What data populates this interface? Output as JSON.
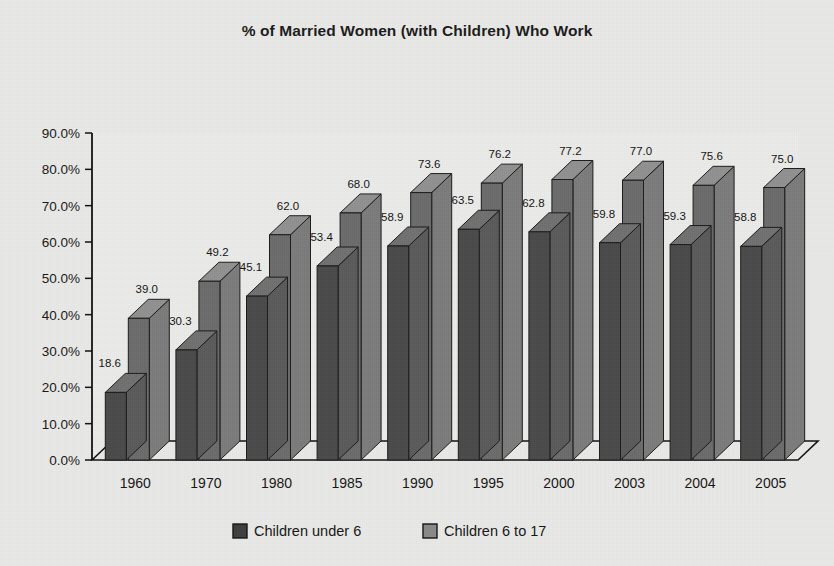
{
  "chart_data": {
    "type": "bar",
    "title": "% of Married Women (with Children) Who Work",
    "xlabel": "",
    "ylabel": "",
    "categories": [
      "1960",
      "1970",
      "1980",
      "1985",
      "1990",
      "1995",
      "2000",
      "2003",
      "2004",
      "2005"
    ],
    "series": [
      {
        "name": "Children under 6",
        "color": "#4a4a4a",
        "values": [
          18.6,
          30.3,
          45.1,
          53.4,
          58.9,
          63.5,
          62.8,
          59.8,
          59.3,
          58.8
        ]
      },
      {
        "name": "Children 6 to 17",
        "color": "#6b6b6b",
        "values": [
          39.0,
          49.2,
          62.0,
          68.0,
          73.6,
          76.2,
          77.2,
          77.0,
          75.6,
          75.0
        ]
      }
    ],
    "ylim": [
      0,
      90
    ],
    "ytick_values": [
      0,
      10,
      20,
      30,
      40,
      50,
      60,
      70,
      80,
      90
    ],
    "ytick_labels": [
      "0.0%",
      "10.0%",
      "20.0%",
      "30.0%",
      "40.0%",
      "50.0%",
      "60.0%",
      "70.0%",
      "80.0%",
      "90.0%"
    ],
    "grid": false,
    "legend_position": "bottom",
    "style": "3d-column",
    "data_label_format": "one-decimal"
  },
  "legend": {
    "entries": [
      {
        "label": "Children under 6",
        "swatch_color": "#3f3f3f"
      },
      {
        "label": "Children 6 to 17",
        "swatch_color": "#8a8a8a"
      }
    ]
  },
  "colors": {
    "background": "#e9e9e7",
    "plot_background": "#ebebe9",
    "axis": "#111111",
    "series_dark": "#4a4a4a",
    "series_light": "#6b6b6b",
    "text": "#141414"
  }
}
